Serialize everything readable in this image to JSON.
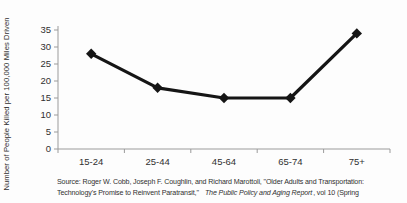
{
  "chart_data": {
    "type": "line",
    "categories": [
      "15-24",
      "25-44",
      "45-64",
      "65-74",
      "75+"
    ],
    "values": [
      28,
      18,
      15,
      15,
      34
    ],
    "title": "",
    "xlabel": "",
    "ylabel": "Number of People Killed per 100,000 Miles Driven",
    "ylim": [
      0,
      35
    ],
    "ytick_step": 5,
    "yticks": [
      0,
      5,
      10,
      15,
      20,
      25,
      30,
      35
    ],
    "grid": false,
    "legend": "none",
    "marker": "diamond",
    "line_color": "#151515",
    "marker_color": "#151515",
    "axis_color": "#9b9b9b",
    "text_color": "#303030"
  },
  "source": {
    "line1": "Source: Roger W. Cobb, Joseph F. Coughlin, and Richard Marottoli, \"Older Adults and Transportation:",
    "line2_pre": "Technology's Promise to Reinvent Paratransit,\"",
    "line2_italic": "The Public Policy and Aging Report",
    "line2_post": ", vol 10 (Spring"
  }
}
